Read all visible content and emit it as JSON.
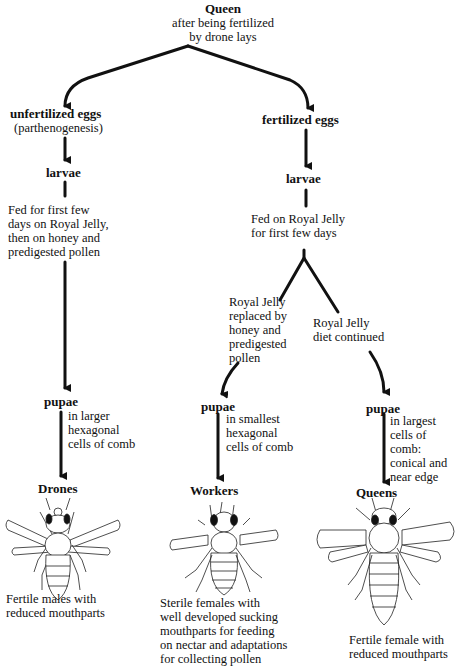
{
  "title": "Queen",
  "subtitle_lines": [
    "after being fertilized",
    "by drone lays"
  ],
  "left_branch": {
    "eggs": "unfertilized eggs",
    "eggs_note": "(parthenogenesis)",
    "larvae": "larvae",
    "feeding_lines": [
      "Fed for first few",
      "days on Royal Jelly,",
      "then on honey and",
      "predigested pollen"
    ],
    "pupae": "pupae",
    "pupae_note_lines": [
      "in larger",
      "hexagonal",
      "cells of comb"
    ],
    "caste": "Drones",
    "description_lines": [
      "Fertile males with",
      "reduced mouthparts"
    ]
  },
  "right_branch": {
    "eggs": "fertilized eggs",
    "larvae": "larvae",
    "feeding_lines": [
      "Fed on Royal Jelly",
      "for first few days"
    ],
    "worker_path": {
      "diet_lines": [
        "Royal Jelly",
        "replaced by",
        "honey and",
        "predigested",
        "pollen"
      ],
      "pupae": "pupae",
      "pupae_note_lines": [
        "in smallest",
        "hexagonal",
        "cells of comb"
      ],
      "caste": "Workers",
      "description_lines": [
        "Sterile females with",
        "well developed sucking",
        "mouthparts for feeding",
        "on nectar and adaptations",
        "for collecting pollen"
      ]
    },
    "queen_path": {
      "diet_lines": [
        "Royal Jelly",
        "diet continued"
      ],
      "pupae": "pupae",
      "pupae_note_lines": [
        "in largest",
        "cells of",
        "comb:",
        "conical and",
        "near edge"
      ],
      "caste": "Queens",
      "description_lines": [
        "Fertile female with",
        "reduced mouthparts"
      ]
    }
  },
  "icons": {
    "drone": "drone-bee-illustration",
    "worker": "worker-bee-illustration",
    "queen": "queen-bee-illustration"
  },
  "colors": {
    "ink": "#111111",
    "background": "#ffffff"
  }
}
